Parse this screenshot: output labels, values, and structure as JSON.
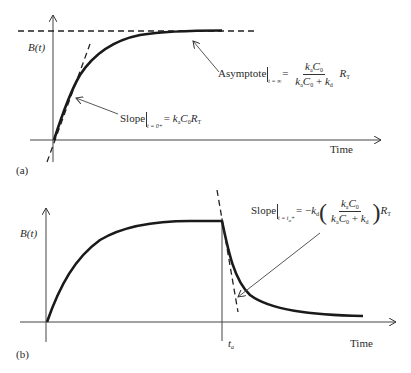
{
  "panel_a": {
    "label": "(a)",
    "y_axis_label": "B(t)",
    "x_axis_label": "Time",
    "asymptote_annotation": {
      "prefix": "Asymptote",
      "condition": "t = ∞",
      "numerator": "kaC0",
      "denominator": "kaC0 + kd",
      "suffix": "RT"
    },
    "slope_annotation": {
      "prefix": "Slope",
      "condition": "t = 0+",
      "expression": "= kaC0RT"
    }
  },
  "panel_b": {
    "label": "(b)",
    "y_axis_label": "B(t)",
    "x_axis_label": "Time",
    "marker_label": "ta",
    "slope_annotation": {
      "prefix": "Slope",
      "condition": "t = ta+",
      "expression": "= −kd((kaC0)/(kaC0 + kd))RT"
    }
  },
  "diagram_data": {
    "type": "line",
    "title": "",
    "panels": [
      {
        "id": "a",
        "curve": "association: B(t) rises from 0 and approaches asymptote",
        "asymptote": "kaC0/(kaC0+kd)·RT",
        "initial_slope": "kaC0RT"
      },
      {
        "id": "b",
        "curve": "association until ta then dissociation decay",
        "slope_at_ta": "−kd(kaC0/(kaC0+kd))RT"
      }
    ]
  }
}
